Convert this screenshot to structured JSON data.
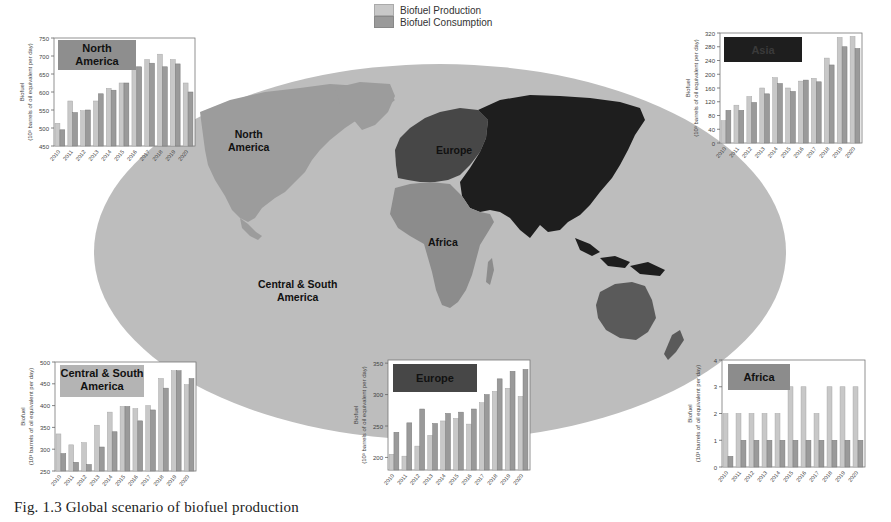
{
  "legend": {
    "items": [
      {
        "label": "Biofuel Production",
        "color": "#c8c8c8"
      },
      {
        "label": "Biofuel Consumption",
        "color": "#9a9a9a"
      }
    ]
  },
  "map": {
    "labels": [
      {
        "text": "North America",
        "lines": [
          "North",
          "America"
        ]
      },
      {
        "text": "Europe",
        "lines": [
          "Europe"
        ]
      },
      {
        "text": "Africa",
        "lines": [
          "Africa"
        ]
      },
      {
        "text": "Central & South America",
        "lines": [
          "Central & South",
          "America"
        ]
      }
    ],
    "colors": {
      "ocean": "#bdbdbd",
      "north_america": "#9c9c9c",
      "europe": "#474747",
      "asia": "#1e1e1e",
      "africa": "#8c8c8c",
      "oceania": "#5a5a5a"
    }
  },
  "caption": "Fig. 1.3  Global scenario of biofuel production",
  "chart_data": [
    {
      "type": "bar",
      "title": "North America",
      "title_box_color": "#8e8e8e",
      "title_text_color": "#111111",
      "categories": [
        "2010",
        "2011",
        "2012",
        "2013",
        "2014",
        "2015",
        "2016",
        "2017",
        "2018",
        "2019",
        "2020"
      ],
      "series": [
        {
          "name": "Biofuel Production",
          "values": [
            513,
            575,
            548,
            575,
            610,
            625,
            670,
            690,
            705,
            690,
            625
          ]
        },
        {
          "name": "Biofuel Consumption",
          "values": [
            495,
            543,
            550,
            595,
            605,
            625,
            670,
            680,
            670,
            678,
            600
          ]
        }
      ],
      "ylabel": "Biofuel (10³ barrels of oil equivalent per day)",
      "ylim": [
        450,
        750
      ],
      "yticks": [
        450,
        500,
        550,
        600,
        650,
        700,
        750
      ],
      "grid": false
    },
    {
      "type": "bar",
      "title": "Asia",
      "title_box_color": "#1e1e1e",
      "title_text_color": "#3a3a3a",
      "categories": [
        "2010",
        "2011",
        "2012",
        "2013",
        "2014",
        "2015",
        "2016",
        "2017",
        "2018",
        "2019",
        "2020"
      ],
      "series": [
        {
          "name": "Biofuel Production",
          "values": [
            65,
            110,
            135,
            160,
            190,
            160,
            180,
            188,
            247,
            307,
            310
          ]
        },
        {
          "name": "Biofuel Consumption",
          "values": [
            95,
            95,
            118,
            143,
            173,
            150,
            183,
            178,
            227,
            280,
            275
          ]
        }
      ],
      "ylabel": "Biofuel (10³ barrels of oil equivalent per day)",
      "ylim": [
        0,
        320
      ],
      "yticks": [
        0,
        40,
        80,
        120,
        160,
        200,
        240,
        280,
        320
      ],
      "grid": false
    },
    {
      "type": "bar",
      "title": "Central & South America",
      "title_box_color": "#b4b4b4",
      "title_text_color": "#111111",
      "categories": [
        "2010",
        "2011",
        "2012",
        "2013",
        "2014",
        "2015",
        "2016",
        "2017",
        "2018",
        "2019",
        "2020"
      ],
      "series": [
        {
          "name": "Biofuel Production",
          "values": [
            335,
            310,
            315,
            355,
            385,
            398,
            393,
            400,
            462,
            480,
            448
          ]
        },
        {
          "name": "Biofuel Consumption",
          "values": [
            290,
            270,
            265,
            305,
            340,
            398,
            365,
            390,
            440,
            480,
            462
          ]
        }
      ],
      "ylabel": "Biofuel (10³ barrels of oil equivalent per day)",
      "ylim": [
        250,
        500
      ],
      "yticks": [
        250,
        300,
        350,
        400,
        450,
        500
      ],
      "grid": false
    },
    {
      "type": "bar",
      "title": "Europe",
      "title_box_color": "#474747",
      "title_text_color": "#111111",
      "categories": [
        "2010",
        "2011",
        "2012",
        "2013",
        "2014",
        "2015",
        "2016",
        "2017",
        "2018",
        "2019",
        "2020"
      ],
      "series": [
        {
          "name": "Biofuel Production",
          "values": [
            205,
            202,
            218,
            235,
            258,
            262,
            253,
            287,
            305,
            310,
            297
          ]
        },
        {
          "name": "Biofuel Consumption",
          "values": [
            240,
            255,
            277,
            254,
            270,
            272,
            277,
            300,
            325,
            337,
            340
          ]
        }
      ],
      "ylabel": "Biofuel (10³ barrels of oil equivalent per day)",
      "ylim": [
        180,
        355
      ],
      "yticks": [
        200,
        250,
        300,
        350
      ],
      "grid": false
    },
    {
      "type": "bar",
      "title": "Africa",
      "title_box_color": "#8c8c8c",
      "title_text_color": "#111111",
      "categories": [
        "2010",
        "2011",
        "2012",
        "2013",
        "2014",
        "2015",
        "2016",
        "2017",
        "2018",
        "2019",
        "2020"
      ],
      "series": [
        {
          "name": "Biofuel Production",
          "values": [
            2,
            2,
            2,
            2,
            2,
            3,
            3,
            2,
            3,
            3,
            3
          ]
        },
        {
          "name": "Biofuel Consumption",
          "values": [
            0.4,
            1,
            1,
            1,
            1,
            1,
            1,
            1,
            1,
            1,
            1
          ]
        }
      ],
      "ylabel": "Biofuel (10³ barrels of oil equivalent per day)",
      "ylim": [
        0,
        4
      ],
      "yticks": [
        0,
        1,
        2,
        3,
        4
      ],
      "grid": false
    }
  ]
}
